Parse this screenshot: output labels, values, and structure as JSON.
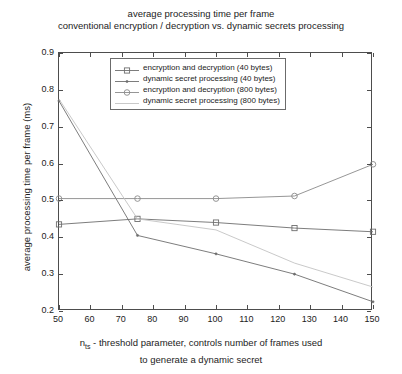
{
  "chart_data": {
    "type": "line",
    "title": "average processing time per frame",
    "subtitle": "conventional encryption / decryption vs. dynamic secrets processing",
    "xlabel_part1": "n",
    "xlabel_sub": "ts",
    "xlabel_part2": " - threshold parameter, controls number of frames used",
    "xlabel_line2": "to generate a dynamic secret",
    "ylabel": "average processing time per frame (ms)",
    "x": [
      50,
      75,
      100,
      125,
      150
    ],
    "xlim": [
      50,
      150
    ],
    "ylim": [
      0.2,
      0.9
    ],
    "xticks": [
      50,
      60,
      70,
      80,
      90,
      100,
      110,
      120,
      130,
      140,
      150
    ],
    "xtick_labels": [
      "50",
      "60",
      "70",
      "80",
      "90",
      "100",
      "110",
      "120",
      "130",
      "140",
      "150"
    ],
    "yticks": [
      0.2,
      0.3,
      0.4,
      0.5,
      0.6,
      0.7,
      0.8,
      0.9
    ],
    "ytick_labels": [
      "0.2",
      "0.3",
      "0.4",
      "0.5",
      "0.6",
      "0.7",
      "0.8",
      "0.9"
    ],
    "grid": false,
    "legend_position": "upper center",
    "series": [
      {
        "name": "encryption and decryption (40 bytes)",
        "marker": "square",
        "color": "#6e6e6e",
        "values": [
          0.435,
          0.45,
          0.44,
          0.425,
          0.415
        ]
      },
      {
        "name": "dynamic secret processing (40 bytes)",
        "marker": "dot",
        "color": "#6e6e6e",
        "values": [
          0.77,
          0.405,
          0.355,
          0.3,
          0.225
        ]
      },
      {
        "name": "encryption and decryption (800 bytes)",
        "marker": "circle",
        "color": "#8a8a8a",
        "values": [
          0.505,
          0.505,
          0.505,
          0.512,
          0.598
        ]
      },
      {
        "name": "dynamic secret processing (800 bytes)",
        "marker": "none",
        "color": "#c3c3c3",
        "values": [
          0.775,
          0.45,
          0.42,
          0.33,
          0.265
        ]
      }
    ]
  },
  "legend": {
    "items": [
      "encryption and decryption (40 bytes)",
      "dynamic secret processing (40 bytes)",
      "encryption and decryption (800 bytes)",
      "dynamic secret processing (800 bytes)"
    ]
  }
}
